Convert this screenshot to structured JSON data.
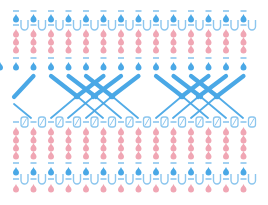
{
  "diagram": {
    "type": "knitting-stitch-chart",
    "width": 268,
    "height": 205,
    "colors": {
      "blue": "#4aa8e6",
      "blue_light": "#8cc6ee",
      "pink": "#f0a6b4",
      "background": "#ffffff"
    },
    "columns_x": [
      16,
      33.5,
      51,
      68.5,
      86,
      103.5,
      121,
      138.5,
      156,
      173.5,
      191,
      208.5,
      226,
      243.5
    ],
    "rows": [
      {
        "y": 11,
        "symbol": "blue-dash"
      },
      {
        "y": 18,
        "symbol": "blue-drop"
      },
      {
        "y": 25,
        "symbol": "dash-u"
      },
      {
        "y": 33,
        "symbol": "pink-drop"
      },
      {
        "y": 41,
        "symbol": "pink-drop"
      },
      {
        "y": 49,
        "symbol": "pink-drop"
      },
      {
        "y": 58,
        "symbol": "blue-dash"
      },
      {
        "y": 66,
        "symbol": "blue-drop"
      },
      {
        "y": 122,
        "symbol": "dash-o"
      },
      {
        "y": 131,
        "symbol": "pink-drop"
      },
      {
        "y": 139,
        "symbol": "pink-drop"
      },
      {
        "y": 147,
        "symbol": "pink-drop"
      },
      {
        "y": 155,
        "symbol": "pink-drop"
      },
      {
        "y": 163,
        "symbol": "blue-dash"
      },
      {
        "y": 171,
        "symbol": "blue-drop"
      },
      {
        "y": 179,
        "symbol": "dash-u"
      },
      {
        "y": 188,
        "symbol": "pink-drop"
      }
    ],
    "cables": [
      {
        "x1": 33.5,
        "y1": 76,
        "x2": 14,
        "y2": 97,
        "weight": "thick"
      },
      {
        "x1": 14,
        "y1": 104,
        "x2": 31,
        "y2": 118,
        "weight": "thin"
      },
      {
        "x1": 51,
        "y1": 76,
        "x2": 78,
        "y2": 97,
        "weight": "thick"
      },
      {
        "x1": 78,
        "y1": 97,
        "x2": 103,
        "y2": 118,
        "weight": "thin"
      },
      {
        "x1": 68.5,
        "y1": 76,
        "x2": 96,
        "y2": 97,
        "weight": "thick"
      },
      {
        "x1": 96,
        "y1": 97,
        "x2": 121,
        "y2": 118,
        "weight": "thin"
      },
      {
        "x1": 86,
        "y1": 76,
        "x2": 113,
        "y2": 97,
        "weight": "thick"
      },
      {
        "x1": 113,
        "y1": 97,
        "x2": 138,
        "y2": 118,
        "weight": "thin"
      },
      {
        "x1": 103.5,
        "y1": 76,
        "x2": 76,
        "y2": 97,
        "weight": "thick"
      },
      {
        "x1": 76,
        "y1": 97,
        "x2": 51,
        "y2": 118,
        "weight": "thin"
      },
      {
        "x1": 121,
        "y1": 76,
        "x2": 93,
        "y2": 97,
        "weight": "thick"
      },
      {
        "x1": 93,
        "y1": 97,
        "x2": 68,
        "y2": 118,
        "weight": "thin"
      },
      {
        "x1": 138.5,
        "y1": 76,
        "x2": 111,
        "y2": 97,
        "weight": "thick"
      },
      {
        "x1": 111,
        "y1": 97,
        "x2": 86,
        "y2": 118,
        "weight": "thin"
      },
      {
        "x1": 156,
        "y1": 76,
        "x2": 183,
        "y2": 97,
        "weight": "thick"
      },
      {
        "x1": 183,
        "y1": 97,
        "x2": 208,
        "y2": 118,
        "weight": "thin"
      },
      {
        "x1": 173.5,
        "y1": 76,
        "x2": 201,
        "y2": 97,
        "weight": "thick"
      },
      {
        "x1": 201,
        "y1": 97,
        "x2": 226,
        "y2": 118,
        "weight": "thin"
      },
      {
        "x1": 191,
        "y1": 76,
        "x2": 218,
        "y2": 97,
        "weight": "thick"
      },
      {
        "x1": 218,
        "y1": 97,
        "x2": 243,
        "y2": 118,
        "weight": "thin"
      },
      {
        "x1": 208.5,
        "y1": 76,
        "x2": 181,
        "y2": 97,
        "weight": "thick"
      },
      {
        "x1": 181,
        "y1": 97,
        "x2": 156,
        "y2": 118,
        "weight": "thin"
      },
      {
        "x1": 226,
        "y1": 76,
        "x2": 198,
        "y2": 97,
        "weight": "thick"
      },
      {
        "x1": 198,
        "y1": 97,
        "x2": 173,
        "y2": 118,
        "weight": "thin"
      },
      {
        "x1": 243.5,
        "y1": 76,
        "x2": 216,
        "y2": 97,
        "weight": "thick"
      },
      {
        "x1": 216,
        "y1": 97,
        "x2": 191,
        "y2": 118,
        "weight": "thin"
      }
    ]
  }
}
